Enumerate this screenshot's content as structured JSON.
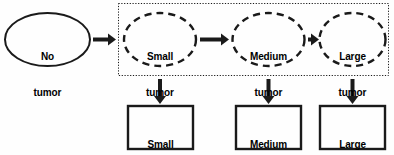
{
  "diagram": {
    "colors": {
      "stroke": "#1a1a1a",
      "background": "#fefefe",
      "text": "#000000",
      "container_border": "#1a1a1a"
    },
    "source_node": {
      "name": "no-tumor",
      "shape": "ellipse",
      "border_style": "solid",
      "label_line1": "No",
      "label_line2": "tumor"
    },
    "container": {
      "name": "preclinical-states-group",
      "border_style": "dotted"
    },
    "hidden_states": [
      {
        "name": "small-tumor-state",
        "shape": "ellipse",
        "border_style": "dashed",
        "label_line1": "Small",
        "label_line2": "tumor"
      },
      {
        "name": "medium-tumor-state",
        "shape": "ellipse",
        "border_style": "dashed",
        "label_line1": "Medium",
        "label_line2": "tumor"
      },
      {
        "name": "large-tumor-state",
        "shape": "ellipse",
        "border_style": "dashed",
        "label_line1": "Large",
        "label_line2": "tumor"
      }
    ],
    "observed_states": [
      {
        "name": "small-tumor-observation",
        "shape": "rectangle",
        "border_style": "solid",
        "label_line1": "Small",
        "label_line2": "tumor"
      },
      {
        "name": "medium-tumor-observation",
        "shape": "rectangle",
        "border_style": "solid",
        "label_line1": "Medium",
        "label_line2": "tumor"
      },
      {
        "name": "large-tumor-observation",
        "shape": "rectangle",
        "border_style": "solid",
        "label_line1": "Large",
        "label_line2": "tumor"
      }
    ],
    "arrows": [
      {
        "name": "arrow-no-tumor-to-small",
        "direction": "right"
      },
      {
        "name": "arrow-small-to-medium",
        "direction": "right"
      },
      {
        "name": "arrow-medium-to-large",
        "direction": "right"
      },
      {
        "name": "arrow-small-state-to-observation",
        "direction": "down"
      },
      {
        "name": "arrow-medium-state-to-observation",
        "direction": "down"
      },
      {
        "name": "arrow-large-state-to-observation",
        "direction": "down"
      }
    ]
  }
}
